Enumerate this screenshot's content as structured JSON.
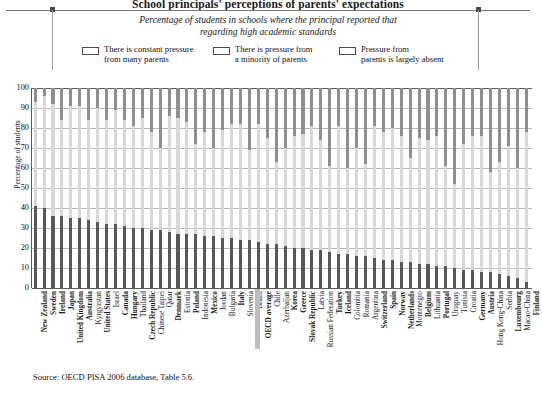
{
  "header": {
    "title": "School principals' perceptions of parents' expectations",
    "subtitle_line1": "Percentage of students in schools where the principal reported that",
    "subtitle_line2": "regarding high academic standards"
  },
  "legend": {
    "items": [
      {
        "label": "There is constant pressure\nfrom many parents",
        "color": "#585858"
      },
      {
        "label": "There is pressure from\na minority of parents",
        "color": "#d8d8d8"
      },
      {
        "label": "Pressure from\nparents is largely absent",
        "color": "#8f8f8f"
      }
    ]
  },
  "source": "Source: OECD PISA 2006 database, Table 5.6.",
  "chart_data": {
    "type": "bar",
    "stacked": true,
    "title": "School principals' perceptions of parents' expectations",
    "subtitle": "Percentage of students in schools where the principal reported that regarding high academic standards",
    "xlabel": "",
    "ylabel": "Percentage of students",
    "ylim": [
      0,
      100
    ],
    "yticks": [
      0,
      10,
      20,
      30,
      40,
      50,
      60,
      70,
      80,
      90,
      100
    ],
    "grid": true,
    "legend_position": "top",
    "categories": [
      "New Zealand",
      "Sweden",
      "Ireland",
      "Japan",
      "United Kingdom",
      "Australia",
      "Kyrgyzstan",
      "United States",
      "Israel",
      "Canada",
      "Hungary",
      "Thailand",
      "Czech Republic",
      "Chinese Taipei",
      "Qatar",
      "Denmark",
      "Estonia",
      "Poland",
      "Indonesia",
      "Mexico",
      "Jordan",
      "Bulgaria",
      "Italy",
      "Slovenia",
      "Brazil",
      "OECD average",
      "Chile",
      "Azerbaijan",
      "Korea",
      "Greece",
      "Slovak Republic",
      "Latvia",
      "Russian Federation",
      "Turkey",
      "Iceland",
      "Colombia",
      "Romania",
      "Argentina",
      "Switzerland",
      "Spain",
      "Norway",
      "Netherlands",
      "Montenegro",
      "Belgium",
      "Lithuania",
      "Portugal",
      "Uruguay",
      "Tunisia",
      "Croatia",
      "Germany",
      "Austria",
      "Hong Kong-China",
      "Serbia",
      "Luxembourg",
      "Macao-China",
      "Finland"
    ],
    "bold_categories": [
      "New Zealand",
      "Sweden",
      "Ireland",
      "Japan",
      "United Kingdom",
      "Australia",
      "United States",
      "Canada",
      "Hungary",
      "Czech Republic",
      "Denmark",
      "Poland",
      "Mexico",
      "Italy",
      "OECD average",
      "Korea",
      "Greece",
      "Slovak Republic",
      "Turkey",
      "Iceland",
      "Switzerland",
      "Spain",
      "Norway",
      "Netherlands",
      "Belgium",
      "Portugal",
      "Germany",
      "Austria",
      "Luxembourg",
      "Finland"
    ],
    "series": [
      {
        "name": "There is constant pressure from many parents",
        "color": "#585858",
        "values": [
          41,
          40,
          36,
          36,
          35,
          35,
          34,
          33,
          32,
          32,
          31,
          30,
          30,
          29,
          29,
          28,
          27,
          27,
          27,
          26,
          26,
          25,
          25,
          24,
          24,
          23,
          22,
          22,
          21,
          20,
          20,
          19,
          19,
          18,
          17,
          17,
          16,
          16,
          15,
          14,
          14,
          13,
          13,
          12,
          12,
          11,
          11,
          10,
          9,
          9,
          8,
          8,
          7,
          6,
          5,
          3
        ]
      },
      {
        "name": "There is pressure from a minority of parents",
        "color": "#d8d8d8",
        "values": [
          52,
          56,
          56,
          48,
          56,
          56,
          50,
          57,
          52,
          57,
          53,
          51,
          55,
          49,
          41,
          58,
          58,
          56,
          45,
          52,
          44,
          54,
          57,
          58,
          45,
          59,
          53,
          41,
          49,
          56,
          57,
          62,
          55,
          43,
          64,
          43,
          54,
          46,
          66,
          64,
          66,
          63,
          52,
          63,
          62,
          65,
          50,
          42,
          63,
          67,
          68,
          50,
          56,
          65,
          55,
          75
        ]
      },
      {
        "name": "Pressure from parents is largely absent",
        "color": "#8f8f8f",
        "values": [
          7,
          4,
          8,
          16,
          9,
          9,
          16,
          10,
          16,
          11,
          16,
          19,
          15,
          22,
          30,
          14,
          15,
          17,
          28,
          22,
          30,
          21,
          18,
          18,
          31,
          18,
          25,
          37,
          30,
          24,
          23,
          19,
          26,
          39,
          19,
          40,
          30,
          38,
          19,
          22,
          20,
          24,
          35,
          25,
          26,
          24,
          39,
          48,
          28,
          24,
          24,
          42,
          37,
          29,
          40,
          22
        ]
      }
    ]
  }
}
